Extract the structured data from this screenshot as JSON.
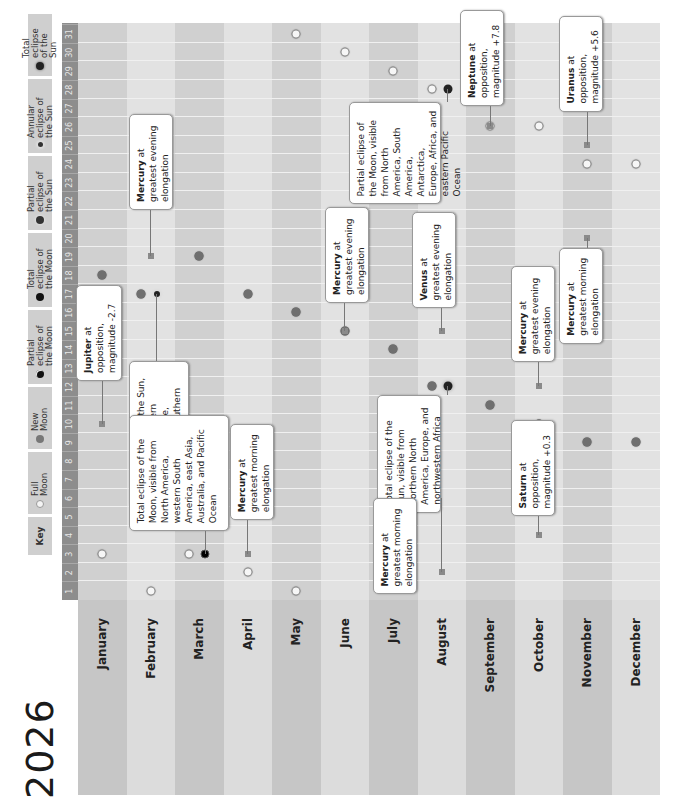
{
  "title": "2026",
  "key": {
    "label": "Key",
    "items": [
      {
        "symbol": "full-moon",
        "label": "Full Moon"
      },
      {
        "symbol": "new-moon",
        "label": "New Moon"
      },
      {
        "symbol": "partial-lunar-eclipse",
        "label": "Partial eclipse of the Moon"
      },
      {
        "symbol": "total-lunar-eclipse",
        "label": "Total eclipse of the Moon"
      },
      {
        "symbol": "partial-solar-eclipse",
        "label": "Partial eclipse of the Sun"
      },
      {
        "symbol": "annular-solar-eclipse",
        "label": "Annular eclipse of the Sun"
      },
      {
        "symbol": "total-solar-eclipse",
        "label": "Total eclipse of the Sun"
      }
    ]
  },
  "days": [
    "1",
    "2",
    "3",
    "4",
    "5",
    "6",
    "7",
    "8",
    "9",
    "10",
    "11",
    "12",
    "13",
    "14",
    "15",
    "16",
    "17",
    "18",
    "19",
    "20",
    "21",
    "22",
    "23",
    "24",
    "25",
    "26",
    "27",
    "28",
    "29",
    "30",
    "31"
  ],
  "months": [
    "January",
    "February",
    "March",
    "April",
    "May",
    "June",
    "July",
    "August",
    "September",
    "October",
    "November",
    "December"
  ],
  "colors": {
    "month_dark": "#c6c6c6",
    "month_light": "#dcdcdc",
    "day_strip": "#8d8d8d"
  },
  "moon_phases": [
    {
      "month": 1,
      "day": 3,
      "type": "full"
    },
    {
      "month": 1,
      "day": 18,
      "type": "new"
    },
    {
      "month": 2,
      "day": 1,
      "type": "full"
    },
    {
      "month": 2,
      "day": 17,
      "type": "new"
    },
    {
      "month": 3,
      "day": 3,
      "type": "full"
    },
    {
      "month": 3,
      "day": 19,
      "type": "new"
    },
    {
      "month": 4,
      "day": 2,
      "type": "full"
    },
    {
      "month": 4,
      "day": 17,
      "type": "new"
    },
    {
      "month": 5,
      "day": 1,
      "type": "full"
    },
    {
      "month": 5,
      "day": 16,
      "type": "new"
    },
    {
      "month": 5,
      "day": 31,
      "type": "full"
    },
    {
      "month": 6,
      "day": 15,
      "type": "new"
    },
    {
      "month": 6,
      "day": 30,
      "type": "full"
    },
    {
      "month": 7,
      "day": 14,
      "type": "new"
    },
    {
      "month": 7,
      "day": 29,
      "type": "full"
    },
    {
      "month": 8,
      "day": 12,
      "type": "new"
    },
    {
      "month": 8,
      "day": 28,
      "type": "full"
    },
    {
      "month": 9,
      "day": 11,
      "type": "new"
    },
    {
      "month": 9,
      "day": 26,
      "type": "full"
    },
    {
      "month": 10,
      "day": 10,
      "type": "new"
    },
    {
      "month": 10,
      "day": 26,
      "type": "full"
    },
    {
      "month": 11,
      "day": 9,
      "type": "new"
    },
    {
      "month": 11,
      "day": 24,
      "type": "full"
    },
    {
      "month": 12,
      "day": 9,
      "type": "new"
    },
    {
      "month": 12,
      "day": 24,
      "type": "full"
    }
  ],
  "eclipses": [
    {
      "month": 2,
      "day": 17,
      "type": "annular-solar",
      "text": "Annular eclipse of the Sun, visible from southern Argentina and Chile, Antarctica, and southern Africa"
    },
    {
      "month": 3,
      "day": 3,
      "type": "total-lunar",
      "text": "Total eclipse of the Moon, visible from North America, western South America, east Asia, Australia, and Pacific Ocean"
    },
    {
      "month": 8,
      "day": 12,
      "type": "total-solar",
      "text": "Total eclipse of the Sun, visible from northern North America, Europe, and northwestern Africa"
    },
    {
      "month": 8,
      "day": 28,
      "type": "partial-lunar",
      "text": "Partial eclipse of the Moon, visible from North America, South America, Antarctica, Europe, Africa, and eastern Pacific Ocean"
    }
  ],
  "events": [
    {
      "month": 1,
      "day": 10,
      "bold": "Jupiter",
      "text": " at opposition, magnitude -2.7"
    },
    {
      "month": 2,
      "day": 19,
      "bold": "Mercury",
      "text": " at greatest evening elongation"
    },
    {
      "month": 4,
      "day": 3,
      "bold": "Mercury",
      "text": " at greatest morning elongation"
    },
    {
      "month": 6,
      "day": 15,
      "bold": "Mercury",
      "text": " at greatest evening elongation"
    },
    {
      "month": 8,
      "day": 2,
      "bold": "Mercury",
      "text": " at greatest morning elongation"
    },
    {
      "month": 8,
      "day": 15,
      "bold": "Venus",
      "text": " at greatest evening elongation"
    },
    {
      "month": 9,
      "day": 26,
      "bold": "Neptune",
      "text": " at opposition, magnitude +7.8"
    },
    {
      "month": 10,
      "day": 4,
      "bold": "Saturn",
      "text": " at opposition, magnitude +0.3"
    },
    {
      "month": 10,
      "day": 12,
      "bold": "Mercury",
      "text": " at greatest evening elongation"
    },
    {
      "month": 11,
      "day": 20,
      "bold": "Mercury",
      "text": " at greatest morning elongation"
    },
    {
      "month": 11,
      "day": 25,
      "bold": "Uranus",
      "text": " at opposition, magnitude +5.6"
    }
  ]
}
